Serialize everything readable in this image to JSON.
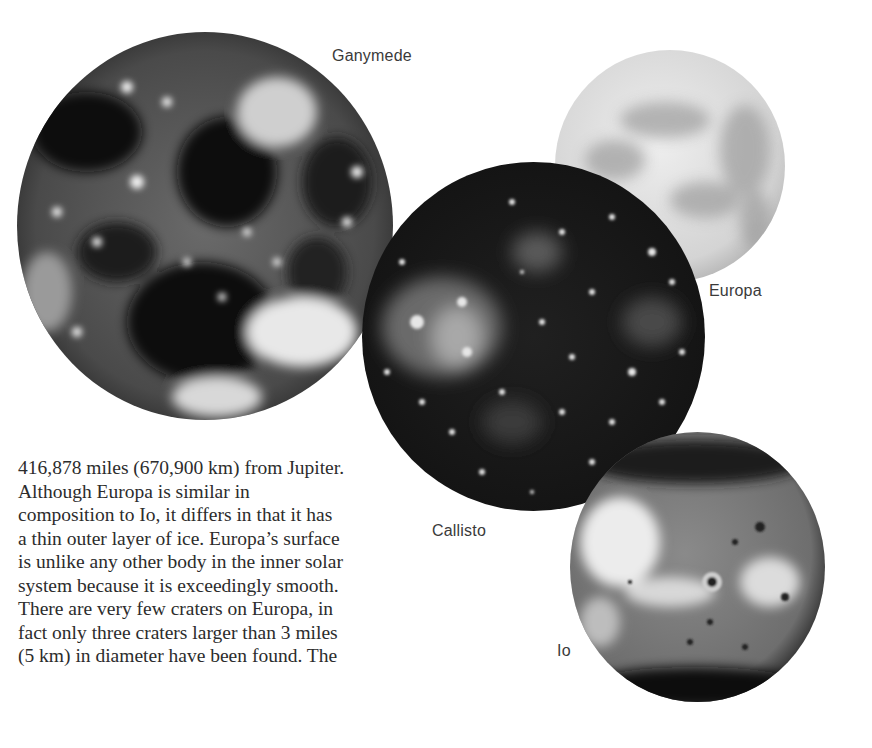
{
  "labels": {
    "ganymede": "Ganymede",
    "europa": "Europa",
    "callisto": "Callisto",
    "io": "Io"
  },
  "paragraph": {
    "lines": [
      "416,878 miles (670,900 km) from Jupiter.",
      "Although Europa is similar in",
      "composition to Io, it differs in that it has",
      "a thin outer layer of ice. Europa’s surface",
      "is unlike any other body in the inner solar",
      "system because it is exceedingly smooth.",
      "There are very few craters on Europa, in",
      "fact only three craters larger than 3 miles",
      "(5 km) in diameter have been found. The"
    ]
  },
  "colors": {
    "background": "#ffffff",
    "text": "#2c2c2c",
    "label_text": "#3a3a3a"
  }
}
